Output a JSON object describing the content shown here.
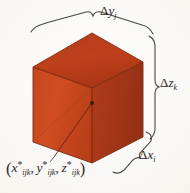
{
  "figure": {
    "name": "rectangular-box-volume-element",
    "type": "3d-diagram",
    "background_color": "#fdfcfa",
    "solid": {
      "shape": "cube",
      "projection": "oblique-isometric",
      "face_colors": {
        "top": "#c0411c",
        "front_left": "#cf4a20",
        "right": "#a8381a"
      },
      "edge_color": "#7d2a12",
      "interior_line_color": "#8e3216"
    },
    "center_point": {
      "marker": "dot",
      "color": "#3a1a0c",
      "x": 92,
      "y": 103
    },
    "leader_line": {
      "from_x": 92,
      "from_y": 103,
      "to_x": 52,
      "to_y": 158,
      "color": "#5d2410"
    }
  },
  "labels": {
    "delta_y": {
      "name": "delta-y-j",
      "delta": "Δ",
      "variable": "y",
      "subscript": "j",
      "full_text": "Δy_j",
      "position": "top"
    },
    "delta_z": {
      "name": "delta-z-k",
      "delta": "Δ",
      "variable": "z",
      "subscript": "k",
      "full_text": "Δz_k",
      "position": "right"
    },
    "delta_x": {
      "name": "delta-x-i",
      "delta": "Δ",
      "variable": "x",
      "subscript": "i",
      "full_text": "Δx_i",
      "position": "bottom-right"
    },
    "sample_point": {
      "name": "sample-point-coordinates",
      "open_paren": "(",
      "close_paren": ")",
      "comma": ",",
      "star": "*",
      "components": [
        {
          "variable": "x",
          "subscript": "ijk"
        },
        {
          "variable": "y",
          "subscript": "ijk"
        },
        {
          "variable": "z",
          "subscript": "ijk"
        }
      ],
      "full_text": "(x*_ijk, y*_ijk, z*_ijk)",
      "position": "bottom-left"
    }
  },
  "braces": {
    "top": {
      "name": "brace-top-delta-y",
      "orientation": "horizontal",
      "color": "#4a4542"
    },
    "right": {
      "name": "brace-right-delta-z",
      "orientation": "vertical",
      "color": "#4a4542"
    },
    "bottom_right": {
      "name": "brace-bottom-right-delta-x",
      "orientation": "diagonal",
      "color": "#4a4542"
    }
  }
}
